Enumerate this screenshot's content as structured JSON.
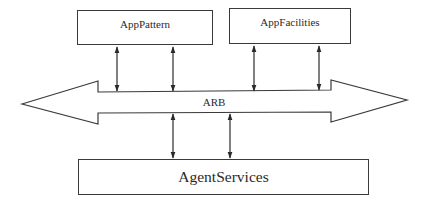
{
  "diagram": {
    "type": "layered-architecture",
    "colors": {
      "stroke": "#3a3a3a",
      "background": "#ffffff",
      "text": "#2a2a2a"
    },
    "boxes": [
      {
        "id": "apppattern",
        "label": "AppPattern",
        "x": 77,
        "y": 10,
        "w": 136,
        "h": 35
      },
      {
        "id": "appfacilities",
        "label": "AppFacilities",
        "x": 229,
        "y": 8,
        "w": 122,
        "h": 36
      },
      {
        "id": "agentservices",
        "label": "AgentServices",
        "x": 78,
        "y": 159,
        "w": 291,
        "h": 36
      }
    ],
    "bus": {
      "label": "ARB",
      "shape": "double-headed-arrow",
      "left_tip": [
        22,
        104
      ],
      "right_tip": [
        407,
        100
      ]
    },
    "connectors": [
      {
        "from": "apppattern",
        "to": "ARB",
        "x": 117,
        "y1": 46,
        "y2": 91,
        "bidirectional": true
      },
      {
        "from": "apppattern",
        "to": "ARB",
        "x": 173,
        "y1": 46,
        "y2": 91,
        "bidirectional": true
      },
      {
        "from": "appfacilities",
        "to": "ARB",
        "x": 254,
        "y1": 45,
        "y2": 91,
        "bidirectional": true
      },
      {
        "from": "appfacilities",
        "to": "ARB",
        "x": 319,
        "y1": 45,
        "y2": 90,
        "bidirectional": true
      },
      {
        "from": "ARB",
        "to": "agentservices",
        "x": 173,
        "y1": 114,
        "y2": 158,
        "bidirectional": true
      },
      {
        "from": "ARB",
        "to": "agentservices",
        "x": 230,
        "y1": 113,
        "y2": 158,
        "bidirectional": true
      }
    ]
  }
}
